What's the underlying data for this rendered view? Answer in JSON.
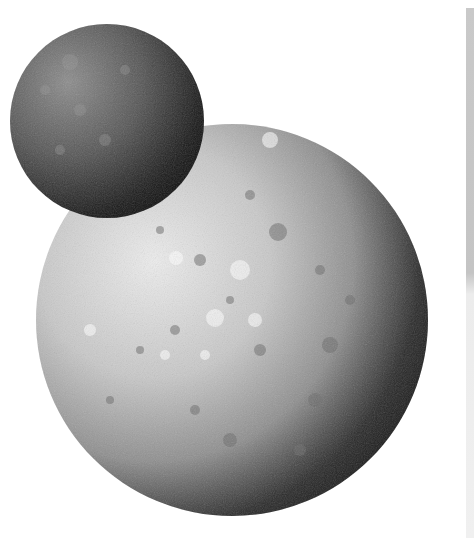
{
  "scene": {
    "description": "Grayscale illustration of two cratered planetary bodies",
    "background": "#ffffff",
    "large_planet": {
      "cx": 232,
      "cy": 320,
      "r": 196,
      "light": "#e8e8e8",
      "mid": "#a8a8a8",
      "shadow": "#0a0a0a"
    },
    "small_moon": {
      "cx": 107,
      "cy": 121,
      "r": 97,
      "light": "#8a8a8a",
      "mid": "#4a4a4a",
      "shadow": "#080808"
    },
    "edge_strip": {
      "color": "#c6c6c6"
    }
  }
}
